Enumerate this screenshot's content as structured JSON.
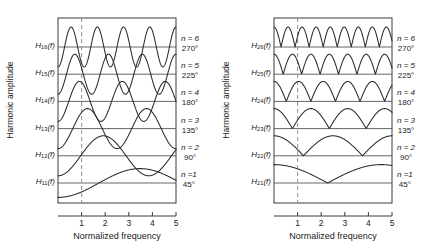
{
  "figure": {
    "ylabel": "Harmonic amplitude",
    "xlabel": "Normalized frequency",
    "xticks": [
      "1",
      "2",
      "3",
      "4",
      "5"
    ]
  },
  "annotations": [
    {
      "n": "n = 6",
      "phase": "270°"
    },
    {
      "n": "n = 5",
      "phase": "225°"
    },
    {
      "n": "n = 4",
      "phase": "180°"
    },
    {
      "n": "n = 3",
      "phase": "135°"
    },
    {
      "n": "n = 2",
      "phase": "90°"
    },
    {
      "n": "n =1",
      "phase": "45°"
    }
  ],
  "panels": [
    {
      "id": "left",
      "trace_labels": [
        "H",
        "H",
        "H",
        "H",
        "H",
        "H"
      ],
      "trace_subs": [
        "16",
        "15",
        "14",
        "13",
        "12",
        "11"
      ],
      "trace_arg": "(f)"
    },
    {
      "id": "right",
      "trace_labels": [
        "H",
        "H",
        "H",
        "H",
        "H",
        "H"
      ],
      "trace_subs": [
        "26",
        "25",
        "24",
        "23",
        "22",
        "21"
      ],
      "trace_arg": "(f)"
    }
  ],
  "chart_data": {
    "type": "line",
    "title": "",
    "xlabel": "Normalized frequency",
    "ylabel": "Harmonic amplitude",
    "xlim": [
      0,
      5
    ],
    "xticks": [
      1,
      2,
      3,
      4,
      5
    ],
    "grid": false,
    "legend": "right-of-axes",
    "reference_line": {
      "x": 1,
      "style": "dashed"
    },
    "panels": [
      {
        "name": "left",
        "series": [
          {
            "name": "H16(f)",
            "n": 6,
            "phase_deg": 270,
            "cycles": 4.5,
            "amplitude": 1.0,
            "baseline_index": 0,
            "bipolar": true,
            "phase_offset_deg": 180
          },
          {
            "name": "H15(f)",
            "n": 5,
            "phase_deg": 225,
            "cycles": 3.5,
            "amplitude": 1.0,
            "baseline_index": 1,
            "bipolar": true,
            "phase_offset_deg": 180
          },
          {
            "name": "H14(f)",
            "n": 4,
            "phase_deg": 180,
            "cycles": 2.75,
            "amplitude": 1.0,
            "baseline_index": 2,
            "bipolar": true,
            "phase_offset_deg": 180
          },
          {
            "name": "H13(f)",
            "n": 3,
            "phase_deg": 135,
            "cycles": 2.0,
            "amplitude": 1.0,
            "baseline_index": 3,
            "bipolar": true,
            "phase_offset_deg": 180
          },
          {
            "name": "H12(f)",
            "n": 2,
            "phase_deg": 90,
            "cycles": 1.3,
            "amplitude": 1.0,
            "baseline_index": 4,
            "bipolar": true,
            "phase_offset_deg": 180
          },
          {
            "name": "H11(f)",
            "n": 1,
            "phase_deg": 45,
            "cycles": 0.72,
            "amplitude": 0.72,
            "baseline_index": 5,
            "bipolar": true,
            "phase_offset_deg": 180
          }
        ]
      },
      {
        "name": "right",
        "series": [
          {
            "name": "H26(f)",
            "n": 6,
            "phase_deg": 270,
            "cycles": 4.2,
            "amplitude": 1.0,
            "baseline_index": 0,
            "bipolar": false,
            "phase_offset_deg": 0
          },
          {
            "name": "H25(f)",
            "n": 5,
            "phase_deg": 225,
            "cycles": 3.2,
            "amplitude": 1.0,
            "baseline_index": 1,
            "bipolar": false,
            "phase_offset_deg": 0
          },
          {
            "name": "H24(f)",
            "n": 4,
            "phase_deg": 180,
            "cycles": 2.4,
            "amplitude": 1.0,
            "baseline_index": 2,
            "bipolar": false,
            "phase_offset_deg": 0
          },
          {
            "name": "H23(f)",
            "n": 3,
            "phase_deg": 135,
            "cycles": 1.6,
            "amplitude": 1.0,
            "baseline_index": 3,
            "bipolar": false,
            "phase_offset_deg": 0
          },
          {
            "name": "H22(f)",
            "n": 2,
            "phase_deg": 90,
            "cycles": 1.0,
            "amplitude": 1.0,
            "baseline_index": 4,
            "bipolar": false,
            "phase_offset_deg": 0
          },
          {
            "name": "H21(f)",
            "n": 1,
            "phase_deg": 45,
            "cycles": 0.55,
            "amplitude": 0.92,
            "baseline_index": 5,
            "bipolar": false,
            "phase_offset_deg": 0
          }
        ]
      }
    ]
  }
}
